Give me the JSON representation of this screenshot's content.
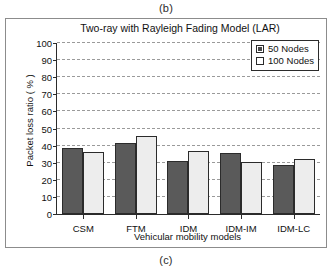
{
  "figure": {
    "caption_top": "(b)",
    "caption_bottom": "(c)"
  },
  "chart_data": {
    "type": "bar",
    "title": "Two-ray with Rayleigh Fading Model (LAR)",
    "xlabel": "Vehicular mobility models",
    "ylabel": "Packet loss ratio ( % )",
    "categories": [
      "CSM",
      "FTM",
      "IDM",
      "IDM-IM",
      "IDM-LC"
    ],
    "series": [
      {
        "name": "50 Nodes",
        "values": [
          38.5,
          41.5,
          31,
          35.5,
          28.5
        ],
        "color": "#5a5a5a"
      },
      {
        "name": "100 Nodes",
        "values": [
          36,
          45.5,
          37,
          30.5,
          32
        ],
        "color": "#ededed"
      }
    ],
    "ylim": [
      0,
      100
    ],
    "yticks": [
      0,
      10,
      20,
      30,
      40,
      50,
      60,
      70,
      80,
      90,
      100
    ],
    "ytick_labels": [
      "0",
      "10",
      "20",
      "30",
      "40",
      "50",
      "60",
      "70",
      "80",
      "90",
      "100"
    ],
    "grid": true,
    "grid_style": "dashed-horizontal",
    "legend_position": "top-right"
  }
}
